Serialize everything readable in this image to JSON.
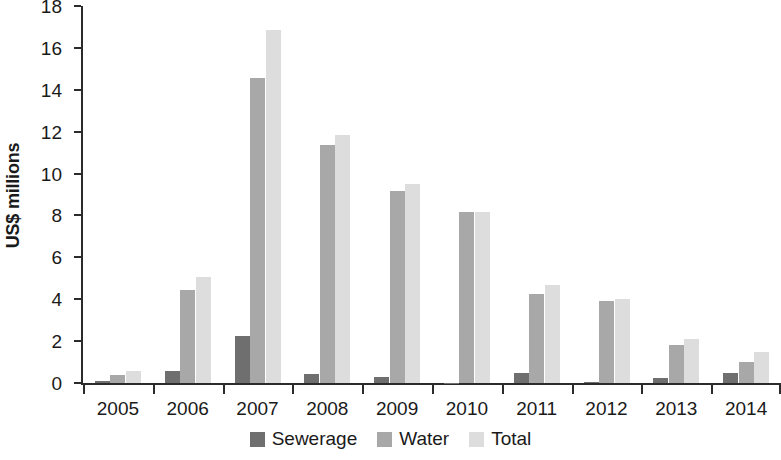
{
  "chart_data": {
    "type": "bar",
    "title": "",
    "subtitle": "",
    "xlabel": "",
    "ylabel": "US$ millions",
    "categories": [
      "2005",
      "2006",
      "2007",
      "2008",
      "2009",
      "2010",
      "2011",
      "2012",
      "2013",
      "2014"
    ],
    "series": [
      {
        "name": "Sewerage",
        "color": "#6f6f6f",
        "values": [
          0.1,
          0.55,
          2.25,
          0.45,
          0.3,
          0.02,
          0.5,
          0.05,
          0.25,
          0.5
        ]
      },
      {
        "name": "Water",
        "color": "#a8a8a8",
        "values": [
          0.4,
          4.45,
          14.55,
          11.35,
          9.15,
          8.15,
          4.25,
          3.9,
          1.8,
          1.0
        ]
      },
      {
        "name": "Total",
        "color": "#dddddd",
        "values": [
          0.55,
          5.05,
          16.85,
          11.85,
          9.5,
          8.15,
          4.7,
          4.0,
          2.1,
          1.5
        ]
      }
    ],
    "ylim": [
      0,
      18
    ],
    "yticks": [
      0,
      2,
      4,
      6,
      8,
      10,
      12,
      14,
      16,
      18
    ],
    "ytick_labels": [
      "0",
      "2",
      "4",
      "6",
      "8",
      "10",
      "12",
      "14",
      "16",
      "18"
    ],
    "grid": false,
    "legend_position": "bottom"
  },
  "legend": {
    "items": [
      {
        "label": "Sewerage",
        "color": "#6f6f6f"
      },
      {
        "label": "Water",
        "color": "#a8a8a8"
      },
      {
        "label": "Total",
        "color": "#dddddd"
      }
    ]
  }
}
